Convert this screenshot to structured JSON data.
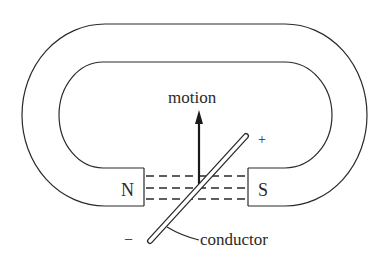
{
  "diagram": {
    "type": "horseshoe-magnet-conductor",
    "labels": {
      "north_pole": "N",
      "south_pole": "S",
      "motion": "motion",
      "conductor": "conductor",
      "positive": "+",
      "negative": "−"
    },
    "colors": {
      "line": "#2a2a2a",
      "background": "#ffffff"
    },
    "field_lines": 3
  }
}
